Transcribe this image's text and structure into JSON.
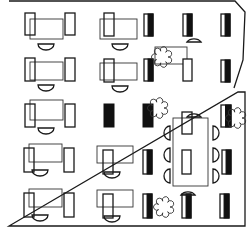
{
  "diagram": {
    "type": "office-floor-plan",
    "width": 248,
    "height": 235,
    "colors": {
      "line": "#1a1a1a",
      "fill_dark": "#111111",
      "background": "#ffffff"
    },
    "walls": {
      "outer": "M9,1 L235,1 L245,12 L243,60 L234,88 M238,92 L245,92 L245,226 L9,226 Z",
      "note": "right wall slants inward with a door gap near y=88-92"
    },
    "workstations": [
      {
        "id": "ws-r1c1",
        "desk": [
          30,
          19,
          33,
          20
        ],
        "chair_l": [
          25,
          13,
          10,
          22
        ],
        "chair_r": [
          65,
          13,
          10,
          22
        ],
        "arc": [
          46,
          44
        ]
      },
      {
        "id": "ws-r2c1",
        "desk": [
          30,
          62,
          33,
          18
        ],
        "chair_l": [
          25,
          58,
          10,
          23
        ],
        "chair_r": [
          65,
          58,
          10,
          23
        ],
        "arc": [
          46,
          85
        ]
      },
      {
        "id": "ws-r3c1",
        "desk": [
          30,
          100,
          33,
          20
        ],
        "chair_l": [
          25,
          104,
          10,
          23
        ],
        "chair_r": [
          65,
          104,
          10,
          23
        ],
        "arc": [
          46,
          128
        ]
      },
      {
        "id": "ws-r4c1",
        "desk": [
          29,
          144,
          33,
          18
        ],
        "chair_l": [
          24,
          148,
          10,
          24
        ],
        "chair_r": [
          64,
          148,
          10,
          24
        ],
        "arc": [
          40,
          170
        ]
      },
      {
        "id": "ws-r5c1",
        "desk": [
          29,
          189,
          33,
          18
        ],
        "chair_l": [
          24,
          193,
          10,
          24
        ],
        "chair_r": [
          64,
          193,
          10,
          24
        ],
        "arc": [
          40,
          215
        ]
      },
      {
        "id": "ws-r1c2",
        "desk": [
          100,
          19,
          37,
          20
        ],
        "chair_l": [
          104,
          13,
          10,
          23
        ],
        "arc": [
          120,
          44
        ]
      },
      {
        "id": "ws-r2c2",
        "desk": [
          100,
          63,
          37,
          17
        ],
        "chair_l": [
          104,
          59,
          10,
          23
        ],
        "arc": [
          120,
          86
        ]
      },
      {
        "id": "ws-r4c2",
        "desk": [
          97,
          146,
          36,
          17
        ],
        "chair_l": [
          103,
          150,
          10,
          24
        ],
        "arc": [
          112,
          172
        ]
      },
      {
        "id": "ws-r5c2",
        "desk": [
          97,
          190,
          36,
          17
        ],
        "chair_l": [
          103,
          194,
          10,
          24
        ],
        "arc": [
          112,
          216
        ]
      },
      {
        "id": "ws-r1c4",
        "desk": [
          155,
          47,
          32,
          17
        ]
      }
    ],
    "cabinets": [
      {
        "id": "cab-r1c3",
        "rect": [
          144,
          14,
          9,
          22
        ],
        "dark": "right"
      },
      {
        "id": "cab-r1c4",
        "rect": [
          183,
          14,
          9,
          22
        ],
        "dark": "right"
      },
      {
        "id": "cab-r1c5",
        "rect": [
          221,
          14,
          9,
          22
        ],
        "dark": "right"
      },
      {
        "id": "cab-r2c3",
        "rect": [
          144,
          59,
          9,
          22
        ],
        "dark": "right"
      },
      {
        "id": "cab-r2c4",
        "rect": [
          183,
          59,
          9,
          22
        ],
        "dark": "none"
      },
      {
        "id": "cab-r2c5",
        "rect": [
          221,
          60,
          9,
          22
        ],
        "dark": "right"
      },
      {
        "id": "cab-r3c2",
        "rect": [
          104,
          104,
          10,
          23
        ],
        "dark": "full"
      },
      {
        "id": "cab-r3c3",
        "rect": [
          143,
          104,
          10,
          23
        ],
        "dark": "full"
      },
      {
        "id": "cab-r3c5",
        "rect": [
          221,
          105,
          10,
          22
        ],
        "dark": "right"
      },
      {
        "id": "cab-r4c3",
        "rect": [
          143,
          150,
          9,
          24
        ],
        "dark": "right"
      },
      {
        "id": "cab-r4c5",
        "rect": [
          222,
          150,
          9,
          24
        ],
        "dark": "right"
      },
      {
        "id": "cab-r5c3",
        "rect": [
          143,
          194,
          9,
          24
        ],
        "dark": "right"
      },
      {
        "id": "cab-r5c4",
        "rect": [
          182,
          194,
          9,
          24
        ],
        "dark": "right"
      },
      {
        "id": "cab-r5c5",
        "rect": [
          220,
          194,
          9,
          24
        ],
        "dark": "right"
      }
    ],
    "conference": {
      "table": [
        173,
        118,
        35,
        68
      ],
      "inner_panel": [
        182,
        150,
        9,
        24
      ],
      "top_chair": [
        182,
        112,
        10,
        22
      ],
      "chairs_left_y": [
        133,
        155,
        176
      ],
      "chairs_right_y": [
        133,
        155,
        176
      ],
      "chair_left_x": 164,
      "chair_right_x": 213
    },
    "plants": [
      {
        "id": "plant-1",
        "cx": 162,
        "cy": 57
      },
      {
        "id": "plant-2",
        "cx": 158,
        "cy": 108
      },
      {
        "id": "plant-3",
        "cx": 236,
        "cy": 118
      },
      {
        "id": "plant-4",
        "cx": 164,
        "cy": 207
      }
    ],
    "door_arcs": [
      {
        "id": "door-r1c4",
        "cx": 193,
        "cy": 42
      },
      {
        "id": "door-r3c4",
        "cx": 193,
        "cy": 117
      },
      {
        "id": "door-r5c4",
        "cx": 187,
        "cy": 195
      }
    ]
  }
}
